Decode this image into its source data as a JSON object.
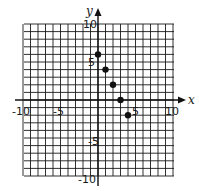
{
  "chart_data": {
    "type": "scatter",
    "title": "",
    "xlabel": "x",
    "ylabel": "y",
    "xlim": [
      -10,
      10
    ],
    "ylim": [
      -10,
      10
    ],
    "grid": true,
    "grid_step": 1,
    "x_tick_labels": [
      "-10",
      "-5",
      "5",
      "10"
    ],
    "y_tick_labels": [
      "10",
      "5",
      "-5",
      "-10"
    ],
    "series": [
      {
        "name": "points",
        "x": [
          0,
          1,
          2,
          3,
          4
        ],
        "y": [
          6,
          4,
          2,
          0,
          -2
        ]
      }
    ],
    "colors": {
      "grid": "#1a1a1a",
      "points": "#111111",
      "background": "#ffffff"
    }
  }
}
